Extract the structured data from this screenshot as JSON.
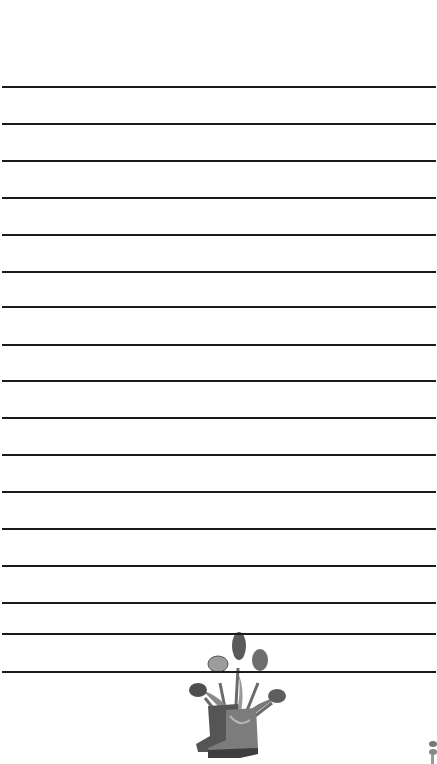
{
  "page": {
    "type": "lined-stationery",
    "background_color": "#ffffff",
    "line_color": "#1a1a1a",
    "line_positions_y": [
      87,
      124,
      161,
      198,
      235,
      272,
      307,
      345,
      381,
      418,
      455,
      492,
      529,
      566,
      603,
      634,
      672
    ]
  },
  "illustration": {
    "subject": "rain-boots-with-tulips",
    "style": "grayscale",
    "position": {
      "x": 180,
      "y": 628,
      "width": 110,
      "height": 128
    }
  },
  "corner_illustration": {
    "subject": "partial-graphic",
    "style": "grayscale",
    "position": {
      "x": 428,
      "y": 738
    }
  }
}
